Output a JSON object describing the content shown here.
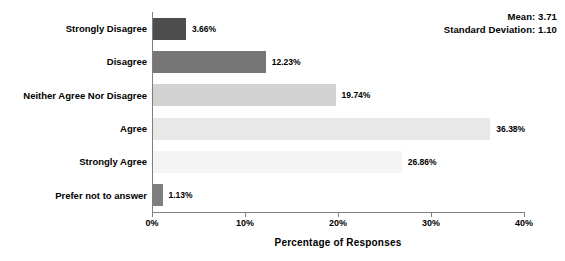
{
  "chart_data": {
    "type": "bar",
    "orientation": "horizontal",
    "title": "",
    "xlabel": "Percentage of Responses",
    "ylabel": "",
    "xlim": [
      0,
      40
    ],
    "xticks": [
      "0%",
      "10%",
      "20%",
      "30%",
      "40%"
    ],
    "xtick_values": [
      0,
      10,
      20,
      30,
      40
    ],
    "grid": false,
    "legend": false,
    "categories": [
      "Strongly Disagree",
      "Disagree",
      "Neither Agree Nor Disagree",
      "Agree",
      "Strongly Agree",
      "Prefer not to answer"
    ],
    "values": [
      3.66,
      12.23,
      19.74,
      36.38,
      26.86,
      1.13
    ],
    "value_labels": [
      "3.66%",
      "12.23%",
      "19.74%",
      "36.38%",
      "26.86%",
      "1.13%"
    ],
    "bar_colors": [
      "#4d4d4d",
      "#767676",
      "#d3d3d3",
      "#e8e8e8",
      "#f4f4f4",
      "#7f7f7f"
    ],
    "annotations": {
      "mean_label": "Mean: 3.71",
      "std_label": "Standard Deviation: 1.10",
      "mean_value": 3.71,
      "std_value": 1.1
    },
    "axis_color": "#7f7f7f",
    "text_color": "#000000",
    "background": "#ffffff"
  }
}
